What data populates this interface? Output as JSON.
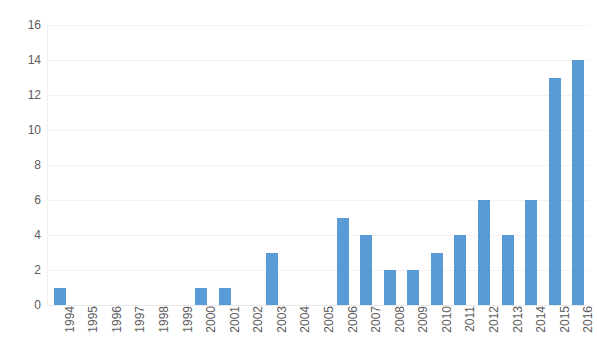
{
  "chart_data": {
    "type": "bar",
    "title": "",
    "subtitle": "",
    "xlabel": "",
    "ylabel": "",
    "categories": [
      "1994",
      "1995",
      "1996",
      "1997",
      "1998",
      "1999",
      "2000",
      "2001",
      "2002",
      "2003",
      "2004",
      "2005",
      "2006",
      "2007",
      "2008",
      "2009",
      "2010",
      "2011",
      "2012",
      "2013",
      "2014",
      "2015",
      "2016"
    ],
    "values": [
      1,
      0,
      0,
      0,
      0,
      0,
      1,
      1,
      0,
      3,
      0,
      0,
      5,
      4,
      2,
      2,
      3,
      4,
      6,
      4,
      6,
      13,
      14
    ],
    "series": [
      {
        "name": "",
        "values": [
          1,
          0,
          0,
          0,
          0,
          0,
          1,
          1,
          0,
          3,
          0,
          0,
          5,
          4,
          2,
          2,
          3,
          4,
          6,
          4,
          6,
          13,
          14
        ]
      }
    ],
    "ylim": [
      0,
      16
    ],
    "ytick_values": [
      0,
      2,
      4,
      6,
      8,
      10,
      12,
      14,
      16
    ],
    "ytick_labels": [
      "0",
      "2",
      "4",
      "6",
      "8",
      "10",
      "12",
      "14",
      "16"
    ],
    "grid": true,
    "grid_axis": "y",
    "legend": false,
    "legend_position": "none",
    "bar_color": "#5b9bd5",
    "grid_color": "#f2f2f2",
    "tick_label_color": "#5b5b5b",
    "background_color": "#ffffff",
    "xtick_rotation": -90,
    "annotations": []
  }
}
